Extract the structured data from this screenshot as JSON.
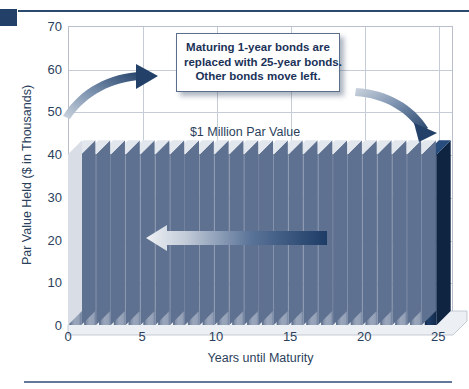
{
  "chart_data": {
    "type": "bar",
    "title": "",
    "subtitle": "",
    "xlabel": "Years until Maturity",
    "ylabel": "Par Value Held ($ in Thousands)",
    "xlim": [
      0,
      26
    ],
    "ylim": [
      0,
      70
    ],
    "ytick_labels": [
      "0",
      "10",
      "20",
      "30",
      "40",
      "50",
      "60",
      "70"
    ],
    "ytick_values": [
      0,
      10,
      20,
      30,
      40,
      50,
      60,
      70
    ],
    "xtick_labels": [
      "0",
      "5",
      "10",
      "15",
      "20",
      "25"
    ],
    "xtick_values": [
      0,
      5,
      10,
      15,
      20,
      25
    ],
    "grid": true,
    "legend": "none",
    "categories": [
      1,
      2,
      3,
      4,
      5,
      6,
      7,
      8,
      9,
      10,
      11,
      12,
      13,
      14,
      15,
      16,
      17,
      18,
      19,
      20,
      21,
      22,
      23,
      24,
      25
    ],
    "values": [
      40,
      40,
      40,
      40,
      40,
      40,
      40,
      40,
      40,
      40,
      40,
      40,
      40,
      40,
      40,
      40,
      40,
      40,
      40,
      40,
      40,
      40,
      40,
      40,
      40
    ],
    "highlighted_category": 25,
    "bar_count": 25,
    "annotations": [
      {
        "name": "par-value-label",
        "text": "$1 Million Par Value"
      },
      {
        "name": "callout",
        "lines": [
          "Maturing 1-year bonds are",
          "replaced with 25-year bonds.",
          "Other bonds move left."
        ]
      }
    ],
    "arrows": [
      {
        "name": "left-curved-arrow-up-right",
        "direction": "up-right"
      },
      {
        "name": "right-curved-arrow-down-right",
        "direction": "down-right"
      },
      {
        "name": "shift-left-arrow",
        "direction": "left"
      }
    ]
  },
  "colors": {
    "bar_face": "#8d9bb2",
    "bar_face_dark": "#5f7190",
    "bar_highlight": "#1b3a66",
    "bar_top": "#dde2ea",
    "accent_navy": "#234168",
    "rule_navy": "#2c4a6e",
    "rule_light": "#64789a",
    "grid": "#c6ccd6",
    "text": "#2b3f5c",
    "callout_text": "#1b3258",
    "callout_border": "#5b6f8d",
    "background": "#ffffff"
  }
}
